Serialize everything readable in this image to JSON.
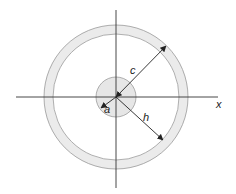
{
  "diagram": {
    "type": "concentric-circles-cross-section",
    "center": [
      116,
      97
    ],
    "outer_ring": {
      "outer_radius": 72,
      "inner_radius": 63,
      "fill": "#ebebeb",
      "stroke": "#9a9a9a"
    },
    "inner_disk": {
      "radius": 20,
      "fill": "#e6e6e6",
      "stroke": "#9a9a9a"
    },
    "axes": {
      "horizontal": {
        "x1": 16,
        "x2": 218,
        "y": 97
      },
      "vertical": {
        "x": 116,
        "y1": 10,
        "y2": 188
      },
      "x_label": "x"
    },
    "dimensions": [
      {
        "label": "c",
        "from": [
          116,
          97
        ],
        "to": [
          166,
          46
        ],
        "meaning": "outer radius (to outer ring)"
      },
      {
        "label": "h",
        "from": [
          116,
          97
        ],
        "to": [
          163,
          140
        ],
        "meaning": "radius to ring"
      },
      {
        "label": "a",
        "from": [
          116,
          97
        ],
        "to": [
          101,
          108
        ],
        "meaning": "inner disk radius"
      }
    ],
    "labels": {
      "c": "c",
      "h": "h",
      "a": "a",
      "x": "x"
    },
    "colors": {
      "line": "#333333",
      "ring_fill": "#ebebeb",
      "disk_fill": "#e6e6e6",
      "ring_stroke": "#9a9a9a"
    }
  }
}
